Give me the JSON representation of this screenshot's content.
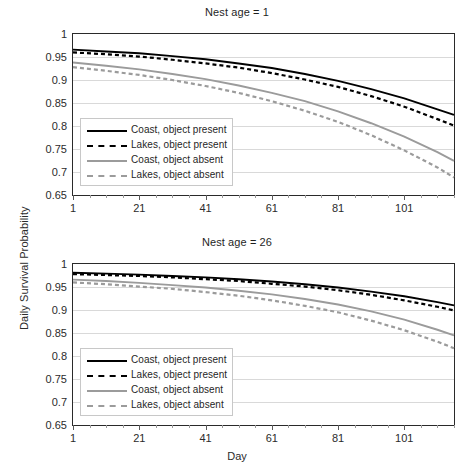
{
  "figure": {
    "ylabel": "Daily Survival Probability",
    "xlabel": "Day",
    "background": "#ffffff"
  },
  "colors": {
    "black": "#000000",
    "gray": "#9b9b9b",
    "grid": "#d9d9d9",
    "axis": "#2a2a2a"
  },
  "legend": {
    "items": [
      {
        "label": "Coast, object present",
        "color": "#000000",
        "style": "solid"
      },
      {
        "label": "Lakes, object present",
        "color": "#000000",
        "style": "dashed"
      },
      {
        "label": "Coast, object absent",
        "color": "#9b9b9b",
        "style": "solid"
      },
      {
        "label": "Lakes, object absent",
        "color": "#9b9b9b",
        "style": "dashed"
      }
    ]
  },
  "chart_data": [
    {
      "type": "line",
      "title": "Nest age = 1",
      "xlabel": "Day",
      "ylabel": "Daily Survival Probability",
      "xlim": [
        1,
        116
      ],
      "ylim": [
        0.65,
        1.0
      ],
      "yticks": [
        1,
        0.95,
        0.9,
        0.85,
        0.8,
        0.75,
        0.7,
        0.65
      ],
      "ytick_labels": [
        "1",
        "0.95",
        "0.9",
        "0.85",
        "0.8",
        "0.75",
        "0.7",
        "0.65"
      ],
      "xticks": [
        1,
        21,
        41,
        61,
        81,
        101
      ],
      "xtick_labels": [
        "1",
        "21",
        "41",
        "61",
        "81",
        "101"
      ],
      "xminor_step": 5,
      "grid": true,
      "legend_position": "lower-left",
      "x": [
        1,
        11,
        21,
        31,
        41,
        51,
        61,
        71,
        81,
        91,
        101,
        111,
        116
      ],
      "series": [
        {
          "name": "Coast, object present",
          "color": "#000000",
          "style": "solid",
          "values": [
            0.966,
            0.962,
            0.958,
            0.952,
            0.945,
            0.936,
            0.926,
            0.913,
            0.898,
            0.88,
            0.86,
            0.836,
            0.824
          ]
        },
        {
          "name": "Lakes, object present",
          "color": "#000000",
          "style": "dashed",
          "values": [
            0.96,
            0.956,
            0.951,
            0.944,
            0.936,
            0.927,
            0.915,
            0.901,
            0.885,
            0.865,
            0.842,
            0.815,
            0.801
          ]
        },
        {
          "name": "Coast, object absent",
          "color": "#9b9b9b",
          "style": "solid",
          "values": [
            0.938,
            0.931,
            0.923,
            0.913,
            0.902,
            0.888,
            0.872,
            0.854,
            0.832,
            0.806,
            0.777,
            0.743,
            0.724
          ]
        },
        {
          "name": "Lakes, object absent",
          "color": "#9b9b9b",
          "style": "dashed",
          "values": [
            0.928,
            0.92,
            0.911,
            0.9,
            0.887,
            0.872,
            0.854,
            0.833,
            0.809,
            0.78,
            0.747,
            0.71,
            0.688
          ]
        }
      ]
    },
    {
      "type": "line",
      "title": "Nest age = 26",
      "xlabel": "Day",
      "ylabel": "Daily Survival Probability",
      "xlim": [
        1,
        116
      ],
      "ylim": [
        0.65,
        1.0
      ],
      "yticks": [
        1,
        0.95,
        0.9,
        0.85,
        0.8,
        0.75,
        0.7,
        0.65
      ],
      "ytick_labels": [
        "1",
        "0.95",
        "0.9",
        "0.85",
        "0.8",
        "0.75",
        "0.7",
        "0.65"
      ],
      "xticks": [
        1,
        21,
        41,
        61,
        81,
        101
      ],
      "xtick_labels": [
        "1",
        "21",
        "41",
        "61",
        "81",
        "101"
      ],
      "xminor_step": 5,
      "grid": true,
      "legend_position": "lower-left",
      "x": [
        1,
        11,
        21,
        31,
        41,
        51,
        61,
        71,
        81,
        91,
        101,
        111,
        116
      ],
      "series": [
        {
          "name": "Coast, object present",
          "color": "#000000",
          "style": "solid",
          "values": [
            0.981,
            0.979,
            0.977,
            0.974,
            0.971,
            0.967,
            0.962,
            0.956,
            0.949,
            0.94,
            0.93,
            0.917,
            0.91
          ]
        },
        {
          "name": "Lakes, object present",
          "color": "#000000",
          "style": "dashed",
          "values": [
            0.978,
            0.976,
            0.974,
            0.971,
            0.967,
            0.963,
            0.957,
            0.951,
            0.943,
            0.933,
            0.921,
            0.907,
            0.899
          ]
        },
        {
          "name": "Coast, object absent",
          "color": "#9b9b9b",
          "style": "solid",
          "values": [
            0.966,
            0.963,
            0.959,
            0.954,
            0.949,
            0.942,
            0.934,
            0.924,
            0.912,
            0.897,
            0.879,
            0.857,
            0.845
          ]
        },
        {
          "name": "Lakes, object absent",
          "color": "#9b9b9b",
          "style": "dashed",
          "values": [
            0.96,
            0.956,
            0.951,
            0.946,
            0.939,
            0.931,
            0.921,
            0.909,
            0.895,
            0.877,
            0.856,
            0.831,
            0.817
          ]
        }
      ]
    }
  ]
}
